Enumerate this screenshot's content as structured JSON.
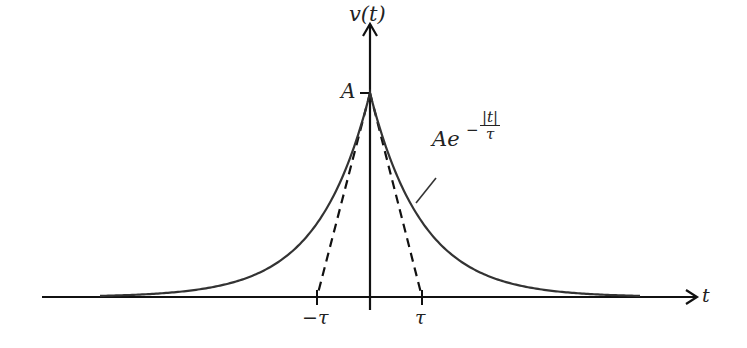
{
  "diagram": {
    "y_axis_label": "v(t)",
    "x_axis_label": "t",
    "peak_label": "A",
    "tick_labels": {
      "negative": "−τ",
      "positive": "τ"
    },
    "curve_label": {
      "base": "Ae",
      "exponent_sign": "−",
      "exponent_numerator": "|t|",
      "exponent_denominator": "τ"
    },
    "colors": {
      "curve": "#333333",
      "axes": "#111111",
      "tangent": "#111111"
    },
    "geometry": {
      "origin_x": 370,
      "axis_y": 297,
      "peak_y": 93,
      "tau_px": 52,
      "x_axis_start": 42,
      "x_axis_end": 697,
      "y_axis_top": 22
    },
    "elements": [
      {
        "name": "exponential-curve",
        "style": "solid",
        "equation": "A*exp(-|t|/tau)"
      },
      {
        "name": "tangent-left",
        "style": "dashed",
        "from": "peak",
        "to": "-tau"
      },
      {
        "name": "tangent-right",
        "style": "dashed",
        "from": "peak",
        "to": "tau"
      }
    ]
  }
}
